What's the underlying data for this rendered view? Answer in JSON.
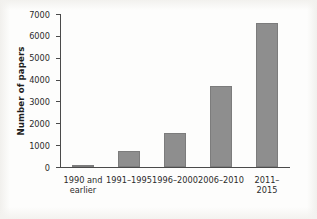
{
  "chart_data": {
    "type": "bar",
    "title": "",
    "xlabel": "",
    "ylabel": "Number of papers",
    "categories": [
      "1990 and\nearlier",
      "1991–1995",
      "1996–2000",
      "2006–2010",
      "2011–2015"
    ],
    "values": [
      30,
      750,
      1560,
      3700,
      6580
    ],
    "ylim": [
      0,
      7000
    ],
    "yticks": [
      0,
      1000,
      2000,
      3000,
      4000,
      5000,
      6000,
      7000
    ],
    "ytick_labels": [
      "0",
      "1000",
      "2000",
      "3000",
      "4000",
      "5000",
      "6000",
      "7000"
    ],
    "grid": false,
    "legend": false,
    "bar_color": "#8e8e8e",
    "bar_edge_color": "#7c7c7c",
    "axis_color": "#4a4a4a",
    "background_color": "#ffffff"
  }
}
